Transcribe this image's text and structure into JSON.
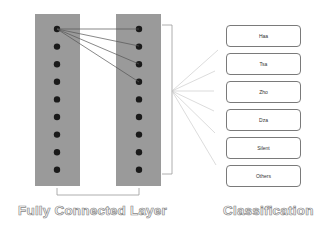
{
  "diagram": {
    "layers": [
      {
        "name": "hidden-layer-1",
        "nodes": 9
      },
      {
        "name": "hidden-layer-2",
        "nodes": 9
      }
    ],
    "connections_shown": [
      [
        0,
        0
      ],
      [
        0,
        1
      ],
      [
        0,
        2
      ],
      [
        0,
        3
      ]
    ],
    "classification": {
      "labels": [
        "Haa",
        "Tsa",
        "Zho",
        "Dza",
        "Silent",
        "Others"
      ]
    },
    "captions": {
      "fully_connected": "Fully Connected Layer",
      "classification": "Classification"
    },
    "colors": {
      "layer_fill": "#9a9a9a",
      "node": "#1a1a1a",
      "line": "#555555",
      "box_border": "#7a7a7a"
    }
  }
}
